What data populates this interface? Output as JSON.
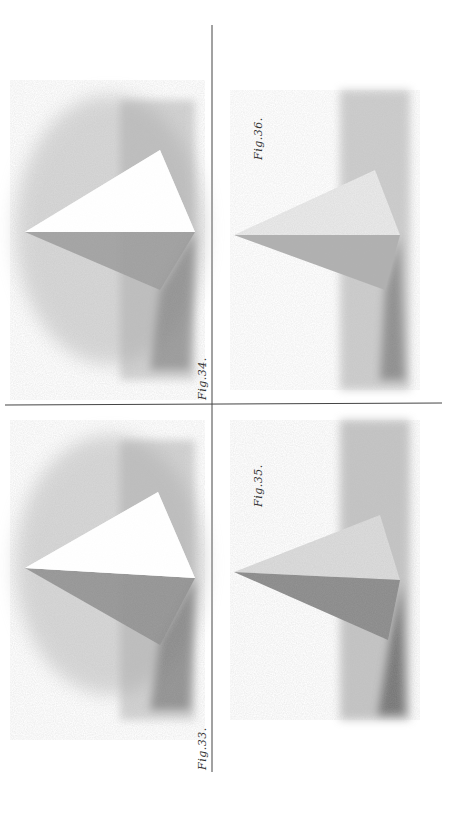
{
  "plate": {
    "orientation": "rotated-90-ccw",
    "background": "#ffffff",
    "ink": "#333333",
    "figures": [
      {
        "id": "fig-33",
        "label": "Fig.33.",
        "quadrant": "bottom-left"
      },
      {
        "id": "fig-34",
        "label": "Fig.34.",
        "quadrant": "top-left"
      },
      {
        "id": "fig-35",
        "label": "Fig.35.",
        "quadrant": "bottom-right"
      },
      {
        "id": "fig-36",
        "label": "Fig.36.",
        "quadrant": "top-right"
      }
    ]
  }
}
